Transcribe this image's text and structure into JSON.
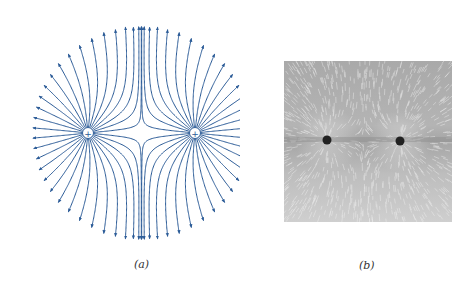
{
  "figure": {
    "panels": [
      {
        "id": "a",
        "caption": "(a)",
        "type": "electric-field-line-diagram",
        "description": "Field lines of two equal positive point charges",
        "charges": [
          {
            "label": "+",
            "sign": "positive"
          },
          {
            "label": "+",
            "sign": "positive"
          }
        ],
        "line_color": "#2b5b97"
      },
      {
        "id": "b",
        "caption": "(b)",
        "type": "photograph",
        "description": "Grass-seed pattern of field lines around two like charges"
      }
    ]
  }
}
